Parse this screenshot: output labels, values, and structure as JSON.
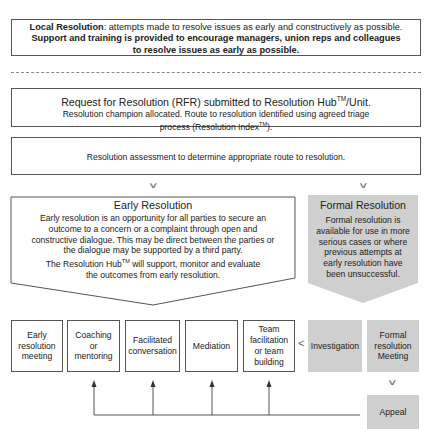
{
  "local_resolution": {
    "title": "Local Resolution",
    "text": ": attempts made to resolve issues as early and constructively as possible.",
    "bold_line1": "Support and training is provided to encourage managers, union reps and colleagues",
    "bold_line2": "to resolve issues as early as possible."
  },
  "rfr": {
    "title_pre": "Request for Resolution (RFR) submitted to Resolution Hub",
    "title_tm": "TM",
    "title_post": "/Unit.",
    "body_line1": "Resolution champion allocated. Route to resolution identified using agreed triage",
    "body_line2_pre": "process (Resolution Index",
    "body_line2_tm": "TM",
    "body_line2_post": ")."
  },
  "assessment": {
    "text": "Resolution assessment to determine appropriate route to resolution."
  },
  "early_resolution": {
    "title": "Early Resolution",
    "line1": "Early resolution is an opportunity for all parties to secure an",
    "line2": "outcome to a concern or a complaint through open and",
    "line3": "constructive dialogue. This may be direct between the parties or",
    "line4": "the dialogue may be supported by a third party.",
    "line5_pre": "The Resolution Hub",
    "line5_tm": "TM",
    "line5_post": " will support, monitor and evaluate",
    "line6": "the outcomes from early resolution."
  },
  "formal_resolution": {
    "title": "Formal Resolution",
    "line1": "Formal resolution is",
    "line2": "available for use in more",
    "line3": "serious cases or where",
    "line4": "previous attempts at",
    "line5": "early resolution have",
    "line6": "been unsuccessful."
  },
  "options": [
    {
      "label_lines": [
        "Early",
        "resolution",
        "meeting"
      ],
      "type": "early"
    },
    {
      "label_lines": [
        "Coaching",
        "or",
        "mentoring"
      ],
      "type": "early"
    },
    {
      "label_lines": [
        "Facilitated",
        "conversation"
      ],
      "type": "early"
    },
    {
      "label_lines": [
        "Mediation"
      ],
      "type": "early"
    },
    {
      "label_lines": [
        "Team",
        "facilitation",
        "or team",
        "building"
      ],
      "type": "early"
    },
    {
      "label_lines": [
        "Investigation"
      ],
      "type": "formal"
    },
    {
      "label_lines": [
        "Formal",
        "resolution",
        "Meeting"
      ],
      "type": "formal"
    }
  ],
  "appeal": {
    "label": "Appeal"
  },
  "glyphs": {
    "chevron_down": "∨",
    "chevron_left": "<"
  },
  "colors": {
    "formal_fill": "#cfcfcf",
    "border": "#555555",
    "arrow": "#555555"
  }
}
